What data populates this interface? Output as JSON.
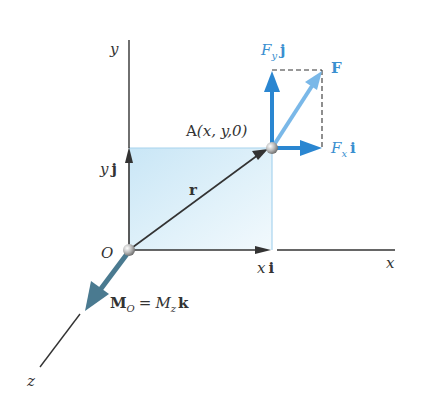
{
  "colors": {
    "axis": "#333333",
    "force_dark": "#2a86d1",
    "force_light": "#7ab8e8",
    "moment": "#4a7a90",
    "plane_fill_top": "#cfe8f6",
    "plane_fill_bottom": "#e8f5fb",
    "plane_edge": "#a8d4ee",
    "dashed": "#333333"
  },
  "axes": {
    "x_label": "x",
    "y_label": "y",
    "z_label": "z",
    "origin_label": "O"
  },
  "point": {
    "name": "A",
    "coords": "(x, y,0)"
  },
  "vectors": {
    "position": "r",
    "x_component": {
      "var": "x",
      "unit": "i"
    },
    "y_component": {
      "var": "y",
      "unit": "j"
    }
  },
  "force": {
    "resultant": "F",
    "fx": {
      "var": "F",
      "sub": "x",
      "unit": "i"
    },
    "fy": {
      "var": "F",
      "sub": "y",
      "unit": "j"
    }
  },
  "moment": {
    "lhs": "M",
    "lhs_sub": "O",
    "equals": "=",
    "rhs": "M",
    "rhs_sub": "z",
    "unit": "k"
  }
}
